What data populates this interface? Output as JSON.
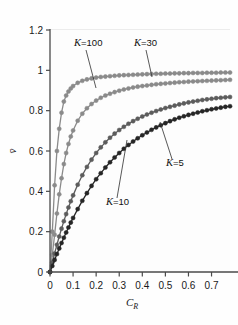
{
  "chart_data": {
    "type": "line",
    "title": "",
    "subtitle": "",
    "xlabel": "C_R",
    "xlabel_main": "C",
    "xlabel_sub": "R",
    "ylabel": "v̄",
    "xlim": [
      0,
      0.78
    ],
    "ylim": [
      0,
      1.2
    ],
    "xticks": [
      0,
      0.1,
      0.2,
      0.3,
      0.4,
      0.5,
      0.6,
      0.7
    ],
    "xticklabels": [
      "0",
      "0.1",
      "0.2",
      "0.3",
      "0.4",
      "0.5",
      "0.6",
      "0.7"
    ],
    "yticks": [
      0,
      0.2,
      0.4,
      0.6,
      0.8,
      1,
      1.2
    ],
    "yticklabels": [
      "0",
      "0.2",
      "0.4",
      "0.6",
      "0.8",
      "1",
      "1.2"
    ],
    "grid": "both",
    "grid_color": "#d7d7d7",
    "legend_position": "inline-annotations",
    "marker": "circle",
    "series": [
      {
        "name": "K=100",
        "label": "K=100",
        "color": "#8a8a8a",
        "x": [
          0,
          0.01,
          0.02,
          0.03,
          0.04,
          0.05,
          0.06,
          0.07,
          0.08,
          0.09,
          0.1,
          0.12,
          0.14,
          0.16,
          0.18,
          0.2,
          0.22,
          0.24,
          0.26,
          0.28,
          0.3,
          0.32,
          0.34,
          0.36,
          0.38,
          0.4,
          0.42,
          0.44,
          0.46,
          0.48,
          0.5,
          0.52,
          0.54,
          0.56,
          0.58,
          0.6,
          0.62,
          0.64,
          0.66,
          0.68,
          0.7,
          0.72,
          0.74,
          0.76,
          0.78
        ],
        "y": [
          0,
          0.2,
          0.43,
          0.6,
          0.71,
          0.79,
          0.845,
          0.875,
          0.895,
          0.91,
          0.922,
          0.938,
          0.948,
          0.955,
          0.96,
          0.964,
          0.967,
          0.969,
          0.971,
          0.973,
          0.975,
          0.976,
          0.977,
          0.978,
          0.979,
          0.98,
          0.981,
          0.982,
          0.983,
          0.983,
          0.984,
          0.984,
          0.985,
          0.985,
          0.986,
          0.986,
          0.987,
          0.987,
          0.987,
          0.988,
          0.988,
          0.988,
          0.989,
          0.989,
          0.989
        ]
      },
      {
        "name": "K=30",
        "label": "K=30",
        "color": "#8a8a8a",
        "x": [
          0,
          0.01,
          0.02,
          0.03,
          0.04,
          0.05,
          0.06,
          0.07,
          0.08,
          0.09,
          0.1,
          0.12,
          0.14,
          0.16,
          0.18,
          0.2,
          0.22,
          0.24,
          0.26,
          0.28,
          0.3,
          0.32,
          0.34,
          0.36,
          0.38,
          0.4,
          0.42,
          0.44,
          0.46,
          0.48,
          0.5,
          0.52,
          0.54,
          0.56,
          0.58,
          0.6,
          0.62,
          0.64,
          0.66,
          0.68,
          0.7,
          0.72,
          0.74,
          0.76,
          0.78
        ],
        "y": [
          0,
          0.085,
          0.185,
          0.29,
          0.385,
          0.465,
          0.535,
          0.59,
          0.635,
          0.672,
          0.702,
          0.75,
          0.785,
          0.812,
          0.833,
          0.85,
          0.864,
          0.875,
          0.884,
          0.892,
          0.899,
          0.905,
          0.91,
          0.915,
          0.919,
          0.922,
          0.925,
          0.928,
          0.931,
          0.933,
          0.935,
          0.937,
          0.939,
          0.941,
          0.942,
          0.944,
          0.945,
          0.946,
          0.947,
          0.948,
          0.949,
          0.95,
          0.951,
          0.952,
          0.953
        ]
      },
      {
        "name": "K=10",
        "label": "K=10",
        "color": "#5c5c5c",
        "x": [
          0,
          0.01,
          0.02,
          0.03,
          0.04,
          0.05,
          0.06,
          0.07,
          0.08,
          0.09,
          0.1,
          0.12,
          0.14,
          0.16,
          0.18,
          0.2,
          0.22,
          0.24,
          0.26,
          0.28,
          0.3,
          0.32,
          0.34,
          0.36,
          0.38,
          0.4,
          0.42,
          0.44,
          0.46,
          0.48,
          0.5,
          0.52,
          0.54,
          0.56,
          0.58,
          0.6,
          0.62,
          0.64,
          0.66,
          0.68,
          0.7,
          0.72,
          0.74,
          0.76,
          0.78
        ],
        "y": [
          0,
          0.047,
          0.092,
          0.135,
          0.176,
          0.215,
          0.252,
          0.287,
          0.32,
          0.351,
          0.38,
          0.433,
          0.48,
          0.521,
          0.557,
          0.59,
          0.618,
          0.643,
          0.666,
          0.686,
          0.704,
          0.72,
          0.735,
          0.748,
          0.76,
          0.771,
          0.781,
          0.79,
          0.798,
          0.806,
          0.813,
          0.819,
          0.825,
          0.831,
          0.836,
          0.841,
          0.845,
          0.849,
          0.853,
          0.856,
          0.859,
          0.862,
          0.864,
          0.866,
          0.868
        ]
      },
      {
        "name": "K=5",
        "label": "K=5",
        "color": "#262626",
        "x": [
          0,
          0.01,
          0.02,
          0.03,
          0.04,
          0.05,
          0.06,
          0.07,
          0.08,
          0.09,
          0.1,
          0.12,
          0.14,
          0.16,
          0.18,
          0.2,
          0.22,
          0.24,
          0.26,
          0.28,
          0.3,
          0.32,
          0.34,
          0.36,
          0.38,
          0.4,
          0.42,
          0.44,
          0.46,
          0.48,
          0.5,
          0.52,
          0.54,
          0.56,
          0.58,
          0.6,
          0.62,
          0.64,
          0.66,
          0.68,
          0.7,
          0.72,
          0.74,
          0.76,
          0.78
        ],
        "y": [
          0,
          0.03,
          0.06,
          0.089,
          0.117,
          0.144,
          0.17,
          0.196,
          0.221,
          0.245,
          0.268,
          0.312,
          0.353,
          0.391,
          0.427,
          0.46,
          0.49,
          0.518,
          0.544,
          0.568,
          0.59,
          0.611,
          0.63,
          0.647,
          0.663,
          0.678,
          0.692,
          0.705,
          0.717,
          0.728,
          0.738,
          0.748,
          0.757,
          0.765,
          0.772,
          0.779,
          0.785,
          0.791,
          0.797,
          0.802,
          0.807,
          0.811,
          0.815,
          0.819,
          0.822
        ]
      }
    ],
    "annotations": [
      {
        "name": "label-k100",
        "text": "K=100",
        "k": "K",
        "rest": "=100",
        "x": 74,
        "y": 46,
        "leader": [
          [
            86,
            50
          ],
          [
            96,
            88
          ]
        ]
      },
      {
        "name": "label-k30",
        "text": "K=30",
        "k": "K",
        "rest": "=30",
        "x": 134,
        "y": 46,
        "leader": [
          [
            146,
            50
          ],
          [
            152,
            77
          ]
        ]
      },
      {
        "name": "label-k10",
        "text": "K=10",
        "k": "K",
        "rest": "=10",
        "x": 106,
        "y": 205,
        "leader": [
          [
            117,
            198
          ],
          [
            127,
            140
          ]
        ]
      },
      {
        "name": "label-k5",
        "text": "K=5",
        "k": "K",
        "rest": "=5",
        "x": 166,
        "y": 166,
        "leader": [
          [
            172,
            159
          ],
          [
            160,
            122
          ]
        ]
      }
    ]
  }
}
